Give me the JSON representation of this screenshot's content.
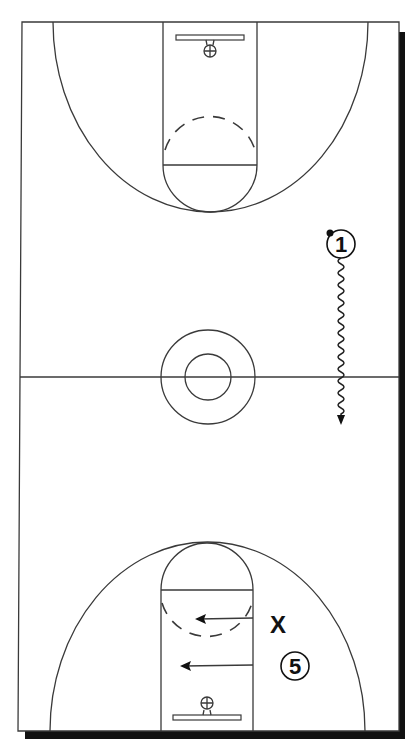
{
  "diagram": {
    "type": "basketball-half-court-play",
    "colors": {
      "lines": "#3a3a3a",
      "shadow": "#111111",
      "background": "#ffffff",
      "players": "#111111"
    },
    "court": {
      "left": 20,
      "right": 399,
      "top": 22,
      "bottom": 731,
      "half_court_y": 377
    },
    "players": [
      {
        "id": "p1",
        "label": "1",
        "type": "offense",
        "x": 341,
        "y": 244,
        "has_ball": true
      },
      {
        "id": "p5",
        "label": "5",
        "type": "offense",
        "x": 295,
        "y": 666,
        "has_ball": false
      },
      {
        "id": "x1",
        "label": "X",
        "type": "defense",
        "x": 278,
        "y": 624
      }
    ],
    "movements": [
      {
        "from": "p1",
        "kind": "dribble",
        "path": "vertical wavy line down past half court",
        "x": 341,
        "y_start": 260,
        "y_end": 425
      },
      {
        "from": "x1",
        "kind": "cut",
        "x_start": 253,
        "x_end": 196,
        "y": 619
      },
      {
        "from": "p5",
        "kind": "cut",
        "x_start": 253,
        "x_end": 180,
        "y": 665
      }
    ]
  }
}
